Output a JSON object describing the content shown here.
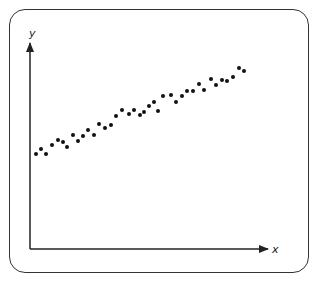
{
  "chart_data": {
    "type": "scatter",
    "title": "",
    "xlabel": "x",
    "ylabel": "y",
    "grid": false,
    "legend": null,
    "xlim": [
      0,
      237
    ],
    "ylim": [
      0,
      207
    ],
    "note": "No tick labels shown; coordinates are in plot units measured from the axes origin (x right, y up).",
    "points": [
      [
        6,
        95
      ],
      [
        11,
        100
      ],
      [
        16,
        95
      ],
      [
        22,
        104
      ],
      [
        28,
        109
      ],
      [
        33,
        107
      ],
      [
        37,
        102
      ],
      [
        43,
        114
      ],
      [
        48,
        108
      ],
      [
        53,
        113
      ],
      [
        58,
        119
      ],
      [
        64,
        114
      ],
      [
        69,
        125
      ],
      [
        75,
        121
      ],
      [
        81,
        124
      ],
      [
        86,
        133
      ],
      [
        92,
        139
      ],
      [
        99,
        135
      ],
      [
        104,
        139
      ],
      [
        110,
        134
      ],
      [
        114,
        137
      ],
      [
        119,
        143
      ],
      [
        124,
        147
      ],
      [
        128,
        138
      ],
      [
        133,
        153
      ],
      [
        141,
        154
      ],
      [
        146,
        147
      ],
      [
        152,
        153
      ],
      [
        157,
        158
      ],
      [
        163,
        158
      ],
      [
        169,
        165
      ],
      [
        174,
        159
      ],
      [
        181,
        170
      ],
      [
        186,
        164
      ],
      [
        192,
        169
      ],
      [
        197,
        168
      ],
      [
        203,
        172
      ],
      [
        209,
        181
      ],
      [
        214,
        178
      ]
    ],
    "trend": "positive linear"
  },
  "colors": {
    "axis": "#222222",
    "point": "#111111",
    "frame": "#333333"
  }
}
